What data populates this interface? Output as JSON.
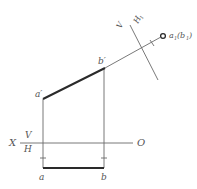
{
  "diagram": {
    "type": "orthographic-projection-auxiliary-view",
    "colors": {
      "line": "#6a6a6a",
      "bold_line": "#2a2a2a",
      "text": "#555555",
      "background": "#ffffff"
    },
    "labels": {
      "axis_x": "X",
      "axis_o": "O",
      "plane_v": "V",
      "plane_h": "H",
      "new_plane_v": "V",
      "new_plane_h1": "H",
      "new_plane_h1_sub": "1",
      "point_a_prime": "a′",
      "point_b_prime": "b′",
      "point_a": "a",
      "point_b": "b",
      "point_a1": "a",
      "point_a1_sub": "1",
      "point_b1_open": "(b",
      "point_b1_sub": "1",
      "point_b1_close": ")"
    },
    "points": {
      "a_prime": [
        43,
        99
      ],
      "b_prime": [
        105,
        68
      ],
      "a": [
        43,
        168
      ],
      "b": [
        104,
        168
      ],
      "a1_b1": [
        163,
        36
      ]
    },
    "axis_xo": {
      "y": 143,
      "x_start": 20,
      "x_end": 133
    },
    "axis_x1": {
      "from": [
        130,
        25
      ],
      "to": [
        158,
        80
      ]
    }
  }
}
